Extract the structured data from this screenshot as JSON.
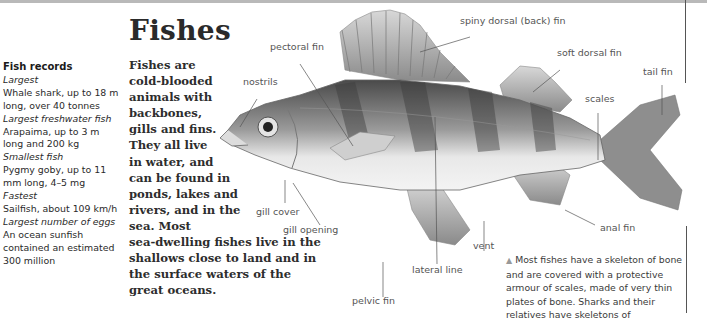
{
  "page": {
    "title": "Fishes",
    "intro_lines": {
      "narrow": "Fishes are cold-blooded animals with backbones, gills and fins. They all live in water, and",
      "mid": "can be found in ponds, lakes and rivers, and in the sea. Most",
      "wide": "sea-dwelling fishes live in the shallows close to land and in the surface waters of the great oceans."
    }
  },
  "sidebar": {
    "heading": "Fish records",
    "records": [
      {
        "label": "Largest",
        "value": "Whale shark, up to 18 m long, over 40 tonnes"
      },
      {
        "label": "Largest freshwater fish",
        "value": "Arapaima, up to 3 m long and 200 kg"
      },
      {
        "label": "Smallest fish",
        "value": "Pygmy goby, up to 11 mm long, 4–5 mg"
      },
      {
        "label": "Fastest",
        "value": "Sailfish, about 109 km/h"
      },
      {
        "label": "Largest number of eggs",
        "value": "An ocean sunfish contained an estimated 300 million"
      }
    ]
  },
  "diagram": {
    "labels": {
      "spiny_dorsal": "spiny dorsal (back) fin",
      "pectoral": "pectoral fin",
      "soft_dorsal": "soft dorsal fin",
      "nostrils": "nostrils",
      "tail": "tail fin",
      "scales": "scales",
      "gill_cover": "gill cover",
      "gill_opening": "gill opening",
      "anal": "anal fin",
      "vent": "vent",
      "lateral_line": "lateral line",
      "pelvic": "pelvic fin"
    }
  },
  "caption": {
    "marker": "▲",
    "text": "Most fishes have a skeleton of bone and are covered with a protective armour of scales, made of very thin plates of bone. Sharks and their relatives have skeletons of"
  },
  "colors": {
    "top_bar": "#b9b9b9",
    "text": "#2a2a2a",
    "label": "#555555"
  }
}
